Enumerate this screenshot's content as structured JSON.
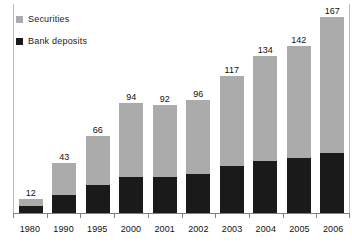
{
  "chart_data": {
    "type": "bar",
    "stacked": true,
    "title": "",
    "subtitle": "",
    "xlabel": "",
    "ylabel": "",
    "grid": false,
    "legend_position": "top-left",
    "ylim": [
      0,
      180
    ],
    "categories": [
      "1980",
      "1990",
      "1995",
      "2000",
      "2001",
      "2002",
      "2003",
      "2004",
      "2005",
      "2006"
    ],
    "totals": [
      12,
      43,
      66,
      94,
      92,
      96,
      117,
      134,
      142,
      167
    ],
    "series": [
      {
        "name": "Bank deposits",
        "color": "#1a1a1a",
        "values": [
          6,
          15,
          24,
          31,
          31,
          33,
          40,
          44,
          47,
          51
        ]
      },
      {
        "name": "Securities",
        "color": "#ababab",
        "values": [
          6,
          28,
          42,
          63,
          61,
          63,
          77,
          90,
          95,
          116
        ]
      }
    ],
    "data_labels": [
      "12",
      "43",
      "66",
      "94",
      "92",
      "96",
      "117",
      "134",
      "142",
      "167"
    ]
  },
  "legend": {
    "items": [
      {
        "label": "Securities",
        "swatch": "securities-swatch"
      },
      {
        "label": "Bank deposits",
        "swatch": "bank-deposits-swatch"
      }
    ]
  },
  "colors": {
    "securities": "#ababab",
    "bank_deposits": "#1a1a1a",
    "axis": "#808080",
    "frame": "#b9b9b9",
    "background": "#ffffff",
    "text": "#111111"
  }
}
